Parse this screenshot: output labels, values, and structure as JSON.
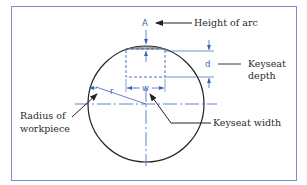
{
  "diagram": {
    "labels": {
      "height_of_arc": "Height of arc",
      "keyseat_depth_line1": "Keyseat",
      "keyseat_depth_line2": "depth",
      "radius_line1": "Radius of",
      "radius_line2": "workpiece",
      "keyseat_width": "Keyseat width"
    },
    "symbols": {
      "arc_height": "A",
      "depth": "d",
      "width": "w",
      "radius": "r"
    },
    "colors": {
      "frame": "#7d8fc4",
      "dimension": "#3b62b8",
      "outline": "#222222",
      "text": "#2a2a2a"
    }
  }
}
